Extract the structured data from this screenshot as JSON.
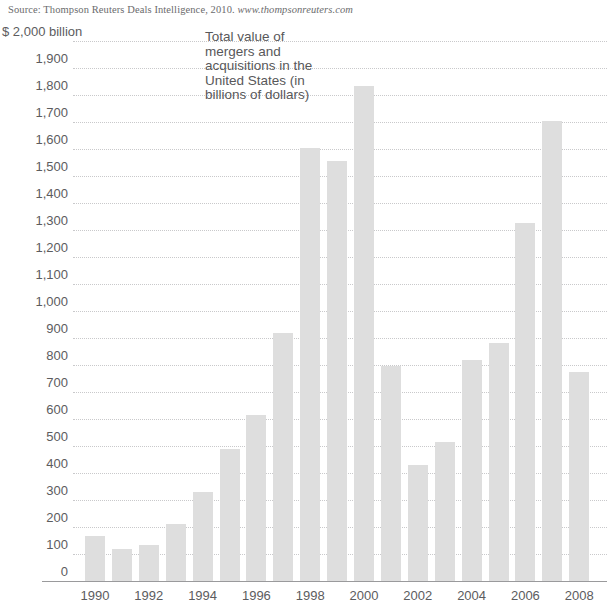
{
  "source": {
    "prefix": "Source: Thompson Reuters Deals Intelligence, 2010.",
    "url": "www.thompsonreuters.com"
  },
  "annotation": {
    "lines": [
      "Total value of",
      "mergers and",
      "acquisitions in the",
      "United States (in",
      "billions of dollars)"
    ]
  },
  "axis": {
    "top_label": "$ 2,000 billion",
    "y_ticks": [
      "2,000",
      "1,900",
      "1,800",
      "1,700",
      "1,600",
      "1,500",
      "1,400",
      "1,300",
      "1,200",
      "1,100",
      "1,000",
      "900",
      "800",
      "700",
      "600",
      "500",
      "400",
      "300",
      "200",
      "100",
      "0"
    ],
    "x_ticks": [
      "1990",
      "1992",
      "1994",
      "1996",
      "1998",
      "2000",
      "2002",
      "2004",
      "2006",
      "2008"
    ]
  },
  "colors": {
    "bar": "#dedede",
    "grid": "#c9c9cb",
    "axis": "#9a9a9c",
    "text": "#58585a"
  },
  "chart_data": {
    "type": "bar",
    "xlabel": "",
    "ylabel": "$ 2,000 billion",
    "ylim": [
      0,
      2000
    ],
    "ytick_step": 100,
    "grid": true,
    "legend": "none",
    "categories": [
      "1990",
      "1991",
      "1992",
      "1993",
      "1994",
      "1995",
      "1996",
      "1997",
      "1998",
      "1999",
      "2000",
      "2001",
      "2002",
      "2003",
      "2004",
      "2005",
      "2006",
      "2007",
      "2008"
    ],
    "values": [
      165,
      120,
      135,
      210,
      330,
      490,
      615,
      920,
      1605,
      1555,
      1835,
      795,
      430,
      515,
      820,
      880,
      1325,
      1705,
      775
    ],
    "labeled_categories": [
      "1990",
      "1992",
      "1994",
      "1996",
      "1998",
      "2000",
      "2002",
      "2004",
      "2006",
      "2008"
    ],
    "source": "Thompson Reuters Deals Intelligence, 2010. www.thompsonreuters.com"
  }
}
